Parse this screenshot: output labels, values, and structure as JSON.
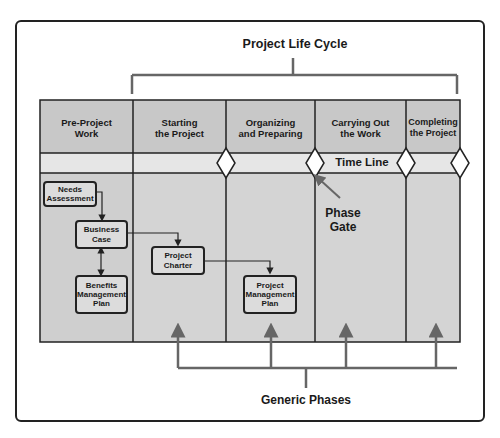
{
  "title": "Project Life Cycle",
  "bottom_label": "Generic Phases",
  "timeline_label": "Time Line",
  "phase_gate_label": [
    "Phase",
    "Gate"
  ],
  "columns": [
    {
      "line1": "Pre-Project",
      "line2": "Work"
    },
    {
      "line1": "Starting",
      "line2": "the Project"
    },
    {
      "line1": "Organizing",
      "line2": "and Preparing"
    },
    {
      "line1": "Carrying Out",
      "line2": "the Work"
    },
    {
      "line1": "Completing",
      "line2": "the Project"
    }
  ],
  "boxes": {
    "needs_assessment": [
      "Needs",
      "Assessment"
    ],
    "business_case": [
      "Business",
      "Case"
    ],
    "benefits_plan": [
      "Benefits",
      "Management",
      "Plan"
    ],
    "project_charter": [
      "Project",
      "Charter"
    ],
    "pm_plan": [
      "Project",
      "Management",
      "Plan"
    ]
  },
  "colors": {
    "header_fill": "#c8c8c8",
    "timeline_fill": "#e6e6e6",
    "body_fill": "#d4d4d4",
    "pre_body_fill": "#cfcfcf",
    "line": "#222222",
    "bracket": "#666666"
  }
}
